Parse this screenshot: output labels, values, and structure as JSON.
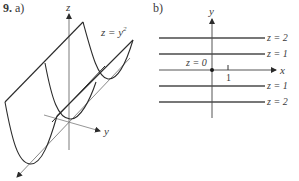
{
  "problem": {
    "number": "9.",
    "part_a_label": "a)",
    "part_b_label": "b)"
  },
  "part_a": {
    "surface_label": "z = y",
    "surface_exponent": "2",
    "axes": {
      "z": "z",
      "y": "y",
      "x": "x"
    }
  },
  "part_b": {
    "axes": {
      "y": "y",
      "x": "x"
    },
    "tick_label": "1",
    "origin_label": "z = 0",
    "level_curves": [
      {
        "label": "z = 2",
        "y_value": 1.414
      },
      {
        "label": "z = 1",
        "y_value": 1
      },
      {
        "label": "z = 1",
        "y_value": -1
      },
      {
        "label": "z = 2",
        "y_value": -1.414
      }
    ]
  },
  "colors": {
    "curve": "#2b2b2b",
    "axis": "#8a8a8a",
    "text": "#3a3a3a"
  }
}
